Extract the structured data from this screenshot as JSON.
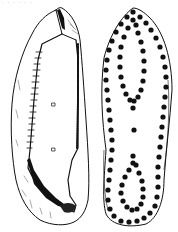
{
  "figure": {
    "caption_fragment": "· · · · · ·",
    "ink_color": "#111111",
    "paper_color": "#ffffff",
    "views": [
      {
        "name": "side-view",
        "label": ""
      },
      {
        "name": "sole-view",
        "label": ""
      }
    ]
  },
  "sole": {
    "hobnails_outer": [
      [
        133,
        12
      ],
      [
        127,
        17
      ],
      [
        121,
        24
      ],
      [
        116,
        32
      ],
      [
        112,
        41
      ],
      [
        109,
        50
      ],
      [
        107,
        60
      ],
      [
        106,
        70
      ],
      [
        106,
        80
      ],
      [
        107,
        90
      ],
      [
        108,
        100
      ],
      [
        109,
        110
      ],
      [
        110,
        120
      ],
      [
        111,
        130
      ],
      [
        112,
        140
      ],
      [
        112,
        150
      ],
      [
        111,
        160
      ],
      [
        110,
        170
      ],
      [
        109,
        180
      ],
      [
        108,
        190
      ],
      [
        108,
        200
      ],
      [
        110,
        209
      ],
      [
        114,
        216
      ],
      [
        121,
        221
      ],
      [
        129,
        222
      ],
      [
        137,
        221
      ],
      [
        144,
        218
      ],
      [
        150,
        213
      ],
      [
        155,
        206
      ],
      [
        157,
        197
      ],
      [
        158,
        187
      ],
      [
        158,
        177
      ],
      [
        158,
        167
      ],
      [
        159,
        157
      ],
      [
        160,
        147
      ],
      [
        161,
        137
      ],
      [
        162,
        127
      ],
      [
        163,
        117
      ],
      [
        164,
        107
      ],
      [
        165,
        97
      ],
      [
        166,
        87
      ],
      [
        166,
        77
      ],
      [
        165,
        67
      ],
      [
        163,
        57
      ],
      [
        160,
        47
      ],
      [
        156,
        38
      ],
      [
        151,
        30
      ],
      [
        146,
        23
      ],
      [
        140,
        17
      ]
    ],
    "hobnails_inner_front": [
      [
        133,
        20
      ],
      [
        128,
        28
      ],
      [
        124,
        37
      ],
      [
        121,
        47
      ],
      [
        120,
        57
      ],
      [
        120,
        67
      ],
      [
        121,
        77
      ],
      [
        123,
        86
      ],
      [
        126,
        94
      ],
      [
        130,
        100
      ],
      [
        134,
        101
      ],
      [
        138,
        97
      ],
      [
        141,
        90
      ],
      [
        143,
        81
      ],
      [
        144,
        71
      ],
      [
        144,
        61
      ],
      [
        143,
        51
      ],
      [
        141,
        42
      ],
      [
        138,
        33
      ],
      [
        136,
        25
      ]
    ],
    "hobnails_center": [
      [
        133,
        108
      ],
      [
        134,
        130
      ]
    ],
    "hobnails_inner_heel": [
      [
        133,
        156
      ],
      [
        133,
        163
      ],
      [
        129,
        170
      ],
      [
        125,
        177
      ],
      [
        122,
        185
      ],
      [
        121,
        193
      ],
      [
        123,
        201
      ],
      [
        127,
        207
      ],
      [
        132,
        210
      ],
      [
        137,
        209
      ],
      [
        141,
        204
      ],
      [
        143,
        197
      ],
      [
        143,
        189
      ],
      [
        142,
        181
      ],
      [
        139,
        173
      ],
      [
        136,
        165
      ]
    ],
    "hobnail_radius": 2.6
  }
}
